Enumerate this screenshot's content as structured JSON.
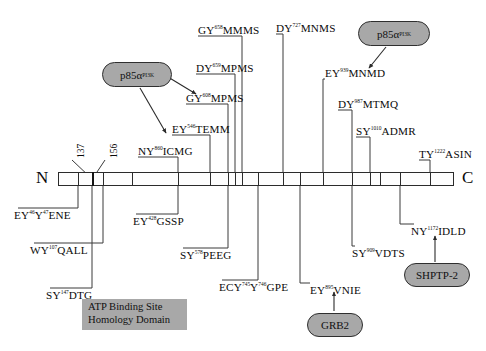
{
  "figure": {
    "type": "protein-domain-map",
    "terminus_n": "N",
    "terminus_c": "C"
  },
  "backbone": {
    "tick_positions_px": [
      58,
      78,
      92,
      103,
      132,
      178,
      210,
      228,
      235,
      242,
      258,
      283,
      292,
      300,
      323,
      352,
      370,
      380,
      400,
      430,
      454
    ]
  },
  "position_markers": [
    {
      "name": "marker-137",
      "label": "137"
    },
    {
      "name": "marker-156",
      "label": "156"
    }
  ],
  "sites_above": [
    {
      "name": "site-ny860-icmg",
      "pre": "NY",
      "sup": "860",
      "post": "ICMG"
    },
    {
      "name": "site-ey546-temm",
      "pre": "EY",
      "sup": "546",
      "post": "TEMM"
    },
    {
      "name": "site-gy608-mpms",
      "pre": "GY",
      "sup": "608",
      "post": "MPMS"
    },
    {
      "name": "site-dy659-mpms",
      "pre": "DY",
      "sup": "659",
      "post": "MPMS"
    },
    {
      "name": "site-gy658-mmms",
      "pre": "GY",
      "sup": "658",
      "post": "MMMS"
    },
    {
      "name": "site-dy727-mnms",
      "pre": "DY",
      "sup": "727",
      "post": "MNMS"
    },
    {
      "name": "site-ey939-mnmd",
      "pre": "EY",
      "sup": "939",
      "post": "MNMD"
    },
    {
      "name": "site-dy987-mtmq",
      "pre": "DY",
      "sup": "987",
      "post": "MTMQ"
    },
    {
      "name": "site-sy1010-admr",
      "pre": "SY",
      "sup": "1010",
      "post": "ADMR"
    },
    {
      "name": "site-ty1222-asin",
      "pre": "TY",
      "sup": "1222",
      "post": "ASIN"
    }
  ],
  "sites_below": [
    {
      "name": "site-ey46-y47-ene",
      "pre": "EY",
      "sup": "46",
      "mid": "Y",
      "sup2": "47",
      "post": "ENE"
    },
    {
      "name": "site-wy107-qall",
      "pre": "WY",
      "sup": "107",
      "post": "QALL"
    },
    {
      "name": "site-sy147-dtg",
      "pre": "SY",
      "sup": "147",
      "post": "DTG"
    },
    {
      "name": "site-ey428-gssp",
      "pre": "EY",
      "sup": "428",
      "post": "GSSP"
    },
    {
      "name": "site-sy578-peeg",
      "pre": "SY",
      "sup": "578",
      "post": "PEEG"
    },
    {
      "name": "site-ecy745-y746-gpe",
      "pre": "ECY",
      "sup": "745",
      "mid": "Y",
      "sup2": "746",
      "post": "GPE"
    },
    {
      "name": "site-ey895-vnie",
      "pre": "EY",
      "sup": "895",
      "post": "VNIE"
    },
    {
      "name": "site-sy909-vdts",
      "pre": "SY",
      "sup": "909",
      "post": "VDTS"
    },
    {
      "name": "site-ny1172-idld",
      "pre": "NY",
      "sup": "1172",
      "post": "IDLD"
    }
  ],
  "binding_partners": [
    {
      "name": "badge-p85a-pi3k-left",
      "text": "p85α",
      "sup": "PI3K"
    },
    {
      "name": "badge-p85a-pi3k-right",
      "text": "p85α",
      "sup": "PI3K"
    },
    {
      "name": "badge-grb2",
      "text": "GRB2",
      "sup": ""
    },
    {
      "name": "badge-shptp2",
      "text": "SHPTP-2",
      "sup": ""
    }
  ],
  "domain_box": {
    "name": "atp-binding-site-domain",
    "line1": "ATP Binding Site",
    "line2": "Homology Domain"
  },
  "colors": {
    "badge_fill": "#a8a8a8",
    "stroke": "#2b2b2b",
    "background": "#ffffff"
  }
}
